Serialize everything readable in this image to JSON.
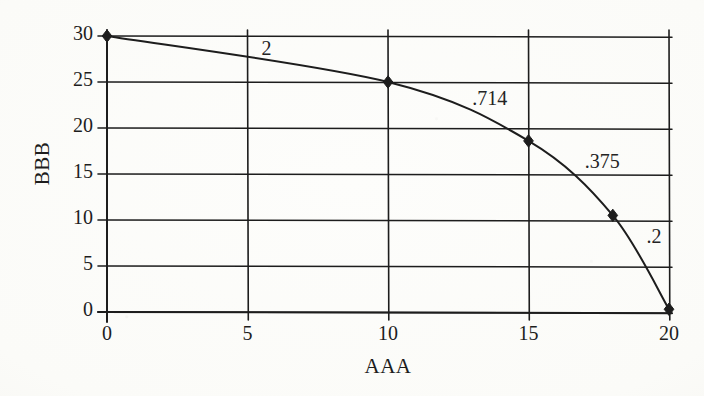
{
  "figure": {
    "background_color": "#fbfbf8",
    "ink_color": "#1d1d1d"
  },
  "axes": {
    "x_title": "AAA",
    "y_title": "BBB",
    "x_ticks": [
      "0",
      "5",
      "10",
      "15",
      "20"
    ],
    "y_ticks": [
      "0",
      "5",
      "10",
      "15",
      "20",
      "25",
      "30"
    ]
  },
  "chart_data": {
    "type": "line",
    "title": "",
    "xlabel": "AAA",
    "ylabel": "BBB",
    "xlim": [
      0,
      20
    ],
    "ylim": [
      0,
      30
    ],
    "xticks": [
      0,
      5,
      10,
      15,
      20
    ],
    "yticks": [
      0,
      5,
      10,
      15,
      20,
      25,
      30
    ],
    "grid": true,
    "legend": "none",
    "series": [
      {
        "name": "BBB",
        "marker": "filled-diamond",
        "line_color": "#1d1d1d",
        "x": [
          0,
          10,
          15,
          18,
          20
        ],
        "y": [
          30,
          25,
          18.6,
          10.5,
          0.3
        ]
      }
    ],
    "annotations": [
      {
        "text": "2",
        "x": 5.5,
        "y": 28.5
      },
      {
        "text": ".714",
        "x": 13.0,
        "y": 23.0
      },
      {
        "text": ".375",
        "x": 17.0,
        "y": 16.2
      },
      {
        "text": ".2",
        "x": 19.2,
        "y": 8.0
      }
    ]
  },
  "markers": {
    "labels": [
      "point-0-30",
      "point-10-25",
      "point-15-18.6",
      "point-18-10.5",
      "point-20-0.3"
    ]
  }
}
